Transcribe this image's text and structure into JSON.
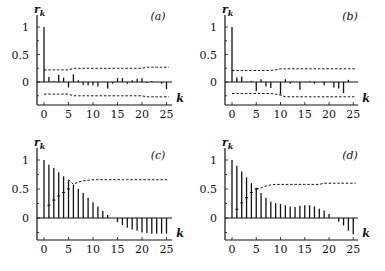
{
  "chart_data": [
    {
      "type": "bar",
      "panel": "(a)",
      "title": "(a)",
      "xlabel": "k",
      "ylabel": "r_k",
      "x": [
        0,
        1,
        2,
        3,
        4,
        5,
        6,
        7,
        8,
        9,
        10,
        11,
        12,
        13,
        14,
        15,
        16,
        17,
        18,
        19,
        20,
        21,
        22,
        23,
        24,
        25
      ],
      "values": [
        1.0,
        0.09,
        0.02,
        0.13,
        0.08,
        -0.1,
        0.14,
        0.03,
        -0.05,
        -0.06,
        -0.06,
        -0.08,
        0.0,
        -0.12,
        -0.03,
        0.07,
        0.07,
        -0.03,
        0.03,
        0.06,
        0.07,
        -0.02,
        0.02,
        0.0,
        -0.03,
        -0.13
      ],
      "upper_bound": [
        0.22,
        0.22,
        0.22,
        0.22,
        0.22,
        0.22,
        0.25,
        0.25,
        0.25,
        0.25,
        0.25,
        0.25,
        0.25,
        0.25,
        0.25,
        0.25,
        0.25,
        0.25,
        0.25,
        0.25,
        0.25,
        0.27,
        0.27,
        0.27,
        0.27,
        0.27
      ],
      "lower_bound": [
        -0.22,
        -0.22,
        -0.22,
        -0.22,
        -0.22,
        -0.22,
        -0.25,
        -0.25,
        -0.25,
        -0.25,
        -0.25,
        -0.25,
        -0.25,
        -0.25,
        -0.25,
        -0.25,
        -0.25,
        -0.25,
        -0.25,
        -0.25,
        -0.25,
        -0.27,
        -0.27,
        -0.27,
        -0.27,
        -0.27
      ],
      "xticks": [
        0,
        5,
        10,
        15,
        20,
        25
      ],
      "yticks": [
        0,
        0.5,
        1
      ],
      "ytick_labels": [
        "0",
        "0.5",
        "1"
      ],
      "xlim": [
        -1.5,
        26.5
      ],
      "ylim": [
        -0.4,
        1.15
      ],
      "grid": false,
      "legend": null
    },
    {
      "type": "bar",
      "panel": "(b)",
      "title": "(b)",
      "xlabel": "k",
      "ylabel": "r_k",
      "x": [
        0,
        1,
        2,
        3,
        4,
        5,
        6,
        7,
        8,
        9,
        10,
        11,
        12,
        13,
        14,
        15,
        16,
        17,
        18,
        19,
        20,
        21,
        22,
        23,
        24,
        25
      ],
      "values": [
        1.0,
        0.08,
        0.1,
        0.01,
        0.02,
        -0.17,
        0.05,
        -0.08,
        -0.11,
        0.0,
        -0.23,
        0.05,
        -0.03,
        0.0,
        -0.14,
        0.0,
        0.01,
        -0.03,
        0.0,
        -0.06,
        0.0,
        -0.1,
        -0.12,
        -0.2,
        0.04,
        0.0
      ],
      "upper_bound": [
        0.21,
        0.21,
        0.21,
        0.21,
        0.21,
        0.21,
        0.21,
        0.21,
        0.21,
        0.22,
        0.24,
        0.24,
        0.24,
        0.24,
        0.24,
        0.24,
        0.24,
        0.24,
        0.24,
        0.24,
        0.24,
        0.24,
        0.24,
        0.24,
        0.24,
        0.24
      ],
      "lower_bound": [
        -0.21,
        -0.21,
        -0.21,
        -0.21,
        -0.21,
        -0.21,
        -0.21,
        -0.21,
        -0.21,
        -0.22,
        -0.24,
        -0.27,
        -0.27,
        -0.27,
        -0.27,
        -0.27,
        -0.27,
        -0.27,
        -0.27,
        -0.27,
        -0.27,
        -0.27,
        -0.27,
        -0.27,
        -0.27,
        -0.27
      ],
      "xticks": [
        0,
        5,
        10,
        15,
        20,
        25
      ],
      "yticks": [
        0,
        0.5,
        1
      ],
      "ytick_labels": [
        "0",
        "0.5",
        "1"
      ],
      "xlim": [
        -1.5,
        26.5
      ],
      "ylim": [
        -0.4,
        1.15
      ],
      "grid": false,
      "legend": null
    },
    {
      "type": "bar",
      "panel": "(c)",
      "title": "(c)",
      "xlabel": "k",
      "ylabel": "r_k",
      "x": [
        0,
        1,
        2,
        3,
        4,
        5,
        6,
        7,
        8,
        9,
        10,
        11,
        12,
        13,
        14,
        15,
        16,
        17,
        18,
        19,
        20,
        21,
        22,
        23,
        24,
        25
      ],
      "values": [
        1.0,
        0.92,
        0.86,
        0.79,
        0.72,
        0.65,
        0.57,
        0.5,
        0.43,
        0.35,
        0.27,
        0.2,
        0.12,
        0.05,
        0.0,
        -0.07,
        -0.12,
        -0.17,
        -0.2,
        -0.22,
        -0.25,
        -0.26,
        -0.27,
        -0.27,
        -0.27,
        -0.27
      ],
      "upper_bound": [
        null,
        null,
        null,
        null,
        null,
        0.66,
        0.58,
        0.62,
        0.64,
        0.65,
        0.66,
        0.66,
        0.66,
        0.66,
        0.66,
        0.66,
        0.66,
        0.66,
        0.66,
        0.66,
        0.66,
        0.66,
        0.66,
        0.66,
        0.66,
        0.66
      ],
      "lower_markers": [
        null,
        0.22,
        0.31,
        0.38,
        0.44,
        0.5
      ],
      "xticks": [
        0,
        5,
        10,
        15,
        20,
        25
      ],
      "yticks": [
        0,
        0.5,
        1
      ],
      "ytick_labels": [
        "0",
        "0.5",
        "1"
      ],
      "xlim": [
        -1.5,
        26.5
      ],
      "ylim": [
        -0.4,
        1.15
      ],
      "grid": false,
      "legend": null
    },
    {
      "type": "bar",
      "panel": "(d)",
      "title": "(d)",
      "xlabel": "k",
      "ylabel": "r_k",
      "x": [
        0,
        1,
        2,
        3,
        4,
        5,
        6,
        7,
        8,
        9,
        10,
        11,
        12,
        13,
        14,
        15,
        16,
        17,
        18,
        19,
        20,
        21,
        22,
        23,
        24,
        25
      ],
      "values": [
        1.0,
        0.9,
        0.8,
        0.7,
        0.6,
        0.52,
        0.43,
        0.35,
        0.28,
        0.26,
        0.24,
        0.22,
        0.2,
        0.19,
        0.21,
        0.22,
        0.22,
        0.2,
        0.16,
        0.13,
        0.07,
        0.0,
        -0.06,
        -0.13,
        -0.22,
        -0.28
      ],
      "upper_bound": [
        null,
        null,
        null,
        null,
        null,
        0.5,
        0.52,
        0.55,
        0.57,
        0.58,
        0.58,
        0.58,
        0.58,
        0.58,
        0.58,
        0.58,
        0.58,
        0.58,
        0.58,
        0.6,
        0.6,
        0.6,
        0.6,
        0.6,
        0.6,
        0.6
      ],
      "lower_markers": [
        null,
        0.15,
        0.26,
        0.35,
        0.44,
        0.5
      ],
      "xticks": [
        0,
        5,
        10,
        15,
        20,
        25
      ],
      "yticks": [
        0,
        0.5,
        1
      ],
      "ytick_labels": [
        "0",
        "0.5",
        "1"
      ],
      "xlim": [
        -1.5,
        26.5
      ],
      "ylim": [
        -0.4,
        1.15
      ],
      "grid": false,
      "legend": null
    }
  ],
  "layout": {
    "panels": [
      {
        "axis_x": 37,
        "x0": 44,
        "dx": 4.9,
        "y_one": 27,
        "y_zero": 82,
        "y_bottom": 105,
        "x_right": 172,
        "tick_label_y": 118,
        "label_x": 158,
        "label_y": 20,
        "k_x": 180,
        "k_y": 102
      },
      {
        "axis_x": 225,
        "x0": 232,
        "dx": 4.85,
        "y_one": 27,
        "y_zero": 82,
        "y_bottom": 105,
        "x_right": 358,
        "tick_label_y": 118,
        "label_x": 350,
        "label_y": 20,
        "k_x": 366,
        "k_y": 102
      },
      {
        "axis_x": 37,
        "x0": 44,
        "dx": 4.9,
        "y_one": 160,
        "y_zero": 218,
        "y_bottom": 240,
        "x_right": 172,
        "tick_label_y": 253,
        "label_x": 158,
        "label_y": 159,
        "k_x": 180,
        "k_y": 237
      },
      {
        "axis_x": 225,
        "x0": 232,
        "dx": 4.85,
        "y_one": 160,
        "y_zero": 218,
        "y_bottom": 240,
        "x_right": 358,
        "tick_label_y": 253,
        "label_x": 350,
        "label_y": 159,
        "k_x": 366,
        "k_y": 237
      }
    ],
    "ink_color": "#111111",
    "background": "#ffffff"
  }
}
